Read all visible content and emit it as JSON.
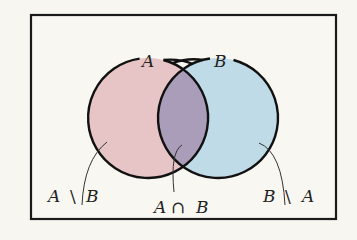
{
  "diagram": {
    "type": "venn",
    "sets": [
      {
        "id": "A",
        "label": "A",
        "fill": "#e7c4c5"
      },
      {
        "id": "B",
        "label": "B",
        "fill": "#bfdbe7"
      }
    ],
    "intersection_fill": "#a99db9",
    "regions": [
      {
        "id": "a-minus-b",
        "label_left": "A",
        "operator": "\\",
        "label_right": "B"
      },
      {
        "id": "a-intersect-b",
        "label_left": "A",
        "operator": "∩",
        "label_right": "B"
      },
      {
        "id": "b-minus-a",
        "label_left": "B",
        "operator": "\\",
        "label_right": "A"
      }
    ],
    "colors": {
      "background": "#f7f6f1",
      "outline": "#111111",
      "frame": "#1a1a1a"
    }
  }
}
